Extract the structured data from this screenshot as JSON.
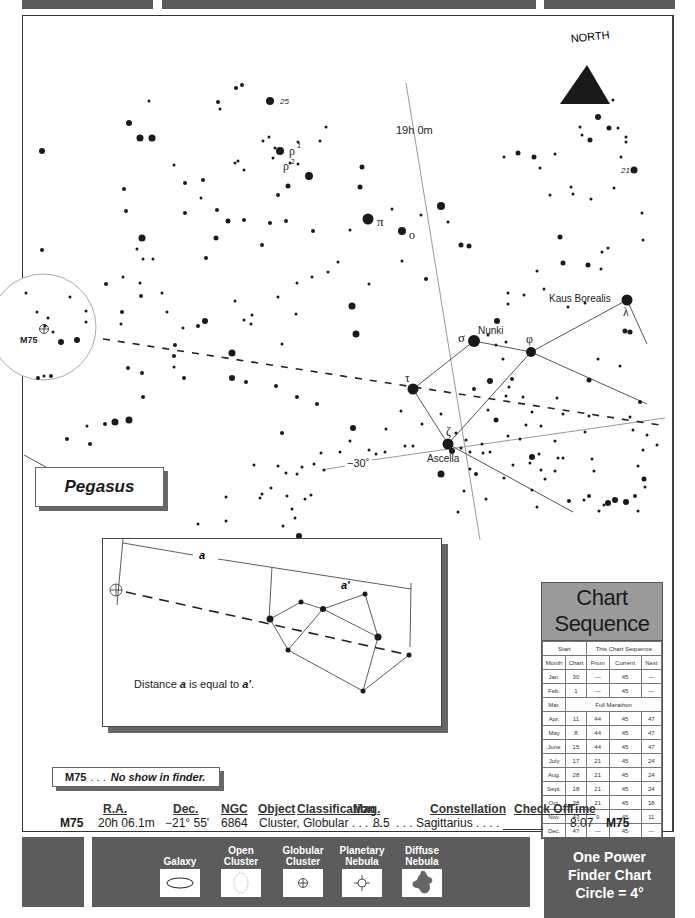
{
  "labels": {
    "north": "NORTH",
    "ra_line": "19h 0m",
    "dec_line": "−30˚",
    "star_25": "25",
    "star_21": "21",
    "rho1": "ρ",
    "rho1_sup": "1",
    "rho2": "ρ",
    "rho2_sup": "2",
    "pi": "π",
    "omicron": "o",
    "sigma": "σ",
    "nunki": "Nunki",
    "phi": "φ",
    "tau": "τ",
    "zeta": "ζ",
    "ascella": "Ascella",
    "kaus_borealis": "Kaus Borealis",
    "lambda": "λ",
    "m75_marker": "M75",
    "constellation_box": "Pegasus"
  },
  "inset": {
    "a_label": "a",
    "a_prime_label": "a'",
    "caption_pre": "Distance ",
    "caption_a": "a",
    "caption_mid": " is equal to ",
    "caption_a2": "a'",
    "caption_post": "."
  },
  "note": {
    "object": "M75",
    "dots": ". . .",
    "text": "No show in finder."
  },
  "chart_sequence": {
    "title": "Chart Sequence",
    "group_headers": [
      "Start",
      "This Chart Sequence"
    ],
    "columns": [
      "Month",
      "Chart",
      "From",
      "Current",
      "Next"
    ],
    "rows": [
      [
        "Jan.",
        "30",
        "—",
        "45",
        "—"
      ],
      [
        "Feb.",
        "1",
        "—",
        "45",
        "—"
      ],
      [
        "Mar.",
        "Full Marathon"
      ],
      [
        "Apr.",
        "11",
        "44",
        "45",
        "47"
      ],
      [
        "May",
        "8",
        "44",
        "45",
        "47"
      ],
      [
        "June",
        "15",
        "44",
        "45",
        "47"
      ],
      [
        "July",
        "17",
        "21",
        "45",
        "24"
      ],
      [
        "Aug.",
        "28",
        "21",
        "45",
        "24"
      ],
      [
        "Sept.",
        "18",
        "21",
        "45",
        "24"
      ],
      [
        "Oct.",
        "38",
        "21",
        "45",
        "18"
      ],
      [
        "Nov.",
        "43",
        "9",
        "45",
        "11"
      ],
      [
        "Dec.",
        "47",
        "—",
        "45",
        "—"
      ]
    ]
  },
  "object_info": {
    "headers": {
      "ra": "R.A.",
      "dec": "Dec.",
      "ngc": "NGC",
      "object": "Object",
      "classification": "Classification",
      "mag": "Mag.",
      "constellation": "Constellation",
      "check_off": "Check Off",
      "time": "Time"
    },
    "values": {
      "id": "M75",
      "ra": "20h 06.1m",
      "dec": "−21° 55'",
      "ngc": "6864",
      "object_class": "Cluster, Globular . . . . . .",
      "mag": "8.5",
      "constellation": ". . . Sagittarius . . . . ______",
      "time": "8:07",
      "id_right": "M75"
    }
  },
  "legend": {
    "items": [
      {
        "label": "Galaxy",
        "symbol": "ellipse"
      },
      {
        "label": "Open Cluster",
        "symbol": "dotted-circle"
      },
      {
        "label": "Globular Cluster",
        "symbol": "circle-plus"
      },
      {
        "label": "Planetary Nebula",
        "symbol": "circle-ticks"
      },
      {
        "label": "Diffuse Nebula",
        "symbol": "blob"
      }
    ]
  },
  "finder": {
    "line1": "One Power",
    "line2": "Finder Chart",
    "line3": "Circle = 4°"
  },
  "colors": {
    "bar_gray": "#5c5c5c",
    "table_header_gray": "#9a9a9a",
    "star_black": "#1a1a1a"
  }
}
